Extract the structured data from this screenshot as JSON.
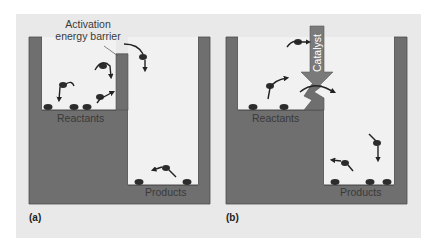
{
  "figure": {
    "panels": [
      {
        "id": "a",
        "panel_label": "(a)",
        "annotation": [
          "Activation",
          "energy barrier"
        ],
        "reactants_label": "Reactants",
        "products_label": "Products"
      },
      {
        "id": "b",
        "panel_label": "(b)",
        "catalyst_label": "Catalyst",
        "reactants_label": "Reactants",
        "products_label": "Products"
      }
    ],
    "colors": {
      "background": "#e9e9e9",
      "wall": "#6f6f6f",
      "wall_edge": "#4a4a4a",
      "well_interior": "#f1f1f1",
      "molecule": "#2c2c2c",
      "catalyst_arrow": "#7a7a7a"
    }
  }
}
